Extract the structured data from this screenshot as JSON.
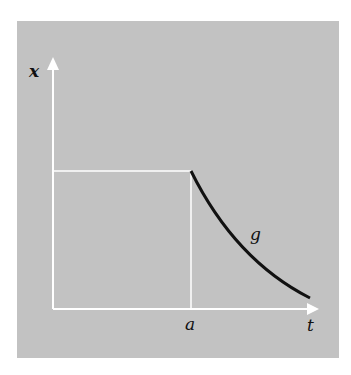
{
  "diagram": {
    "axes": {
      "x_label": "t",
      "y_label": "x"
    },
    "markers": {
      "a_label": "a"
    },
    "curve": {
      "label": "g"
    },
    "colors": {
      "background": "#c2c2c2",
      "axes": "#ffffff",
      "curve": "#111111"
    }
  }
}
